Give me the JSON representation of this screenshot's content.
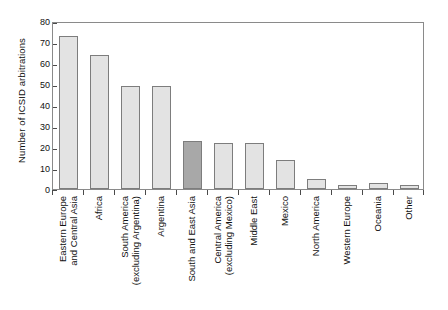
{
  "chart_data": {
    "type": "bar",
    "title": "",
    "subtitle": "",
    "xlabel": "",
    "ylabel": "Number of ICSID arbitrations",
    "ylim": [
      0,
      80
    ],
    "yticks": [
      0,
      10,
      20,
      30,
      40,
      50,
      60,
      70,
      80
    ],
    "ytick_labels": [
      "0",
      "10",
      "20",
      "30",
      "40",
      "50",
      "60",
      "70",
      "80"
    ],
    "grid": false,
    "legend": "none",
    "categories": [
      "Eastern Europe and Central Asia",
      "Africa",
      "South America (excluding Argentina)",
      "Argentina",
      "South and East Asia",
      "Central America (excluding Mexico)",
      "Middle East",
      "Mexico",
      "North America",
      "Western Europe",
      "Oceania",
      "Other"
    ],
    "category_lines": [
      [
        "Eastern Europe",
        "and Central Asia"
      ],
      [
        "Africa",
        ""
      ],
      [
        "South America",
        "(excluding Argentina)"
      ],
      [
        "Argentina",
        ""
      ],
      [
        "South and East Asia",
        ""
      ],
      [
        "Central America",
        "(excluding Mexico)"
      ],
      [
        "Middle East",
        ""
      ],
      [
        "Mexico",
        ""
      ],
      [
        "North America",
        ""
      ],
      [
        "Western Europe",
        ""
      ],
      [
        "Oceania",
        ""
      ],
      [
        "Other",
        ""
      ]
    ],
    "values": [
      73,
      64,
      49,
      49,
      23,
      22,
      22,
      14,
      5,
      2,
      3,
      2
    ],
    "highlight_index": 4,
    "colors": {
      "bar_fill": "#e3e3e3",
      "bar_fill_highlight": "#a8a8a8",
      "bar_edge": "#7d7d7d",
      "axis": "#8a8a8a",
      "text": "#111111"
    }
  }
}
